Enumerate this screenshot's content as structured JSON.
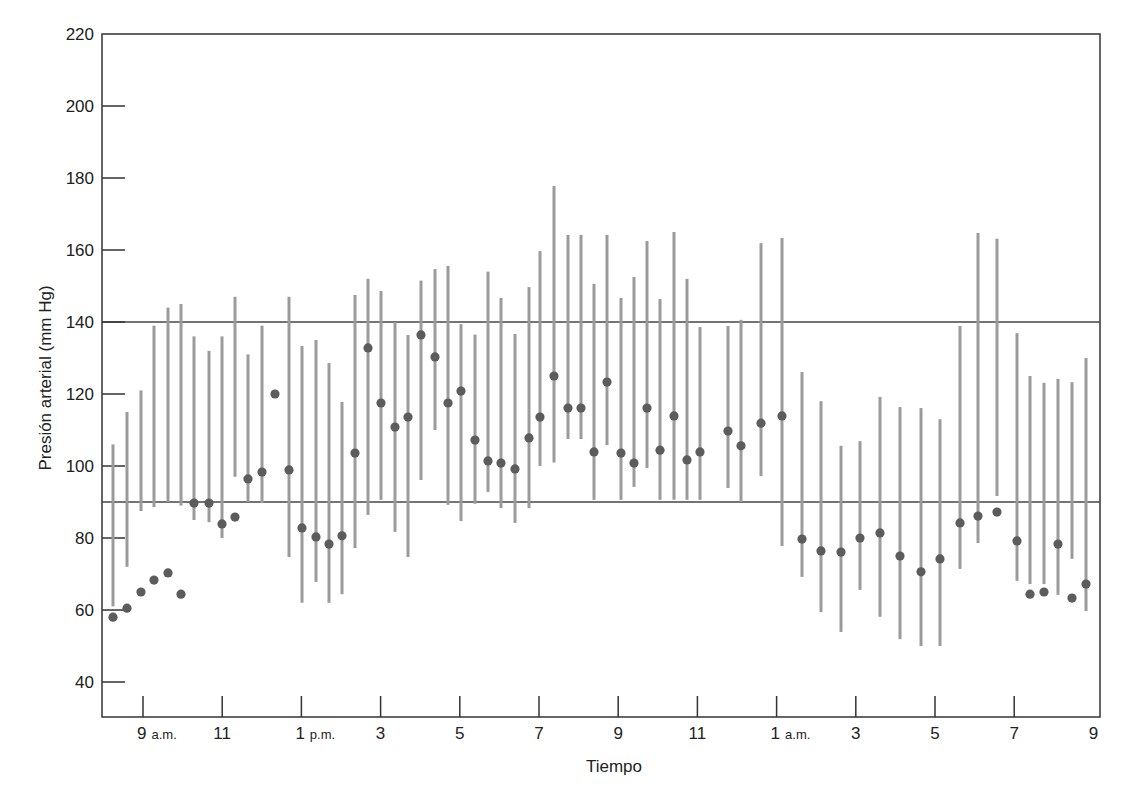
{
  "chart_data": {
    "type": "scatter",
    "subtype": "dot-with-range-bars",
    "title": "",
    "xlabel": "Tiempo",
    "ylabel": "Presión arterial (mm Hg)",
    "ylim": [
      30,
      220
    ],
    "yticks": [
      40,
      60,
      80,
      100,
      120,
      140,
      160,
      180,
      200,
      220
    ],
    "xticks": [
      {
        "label": "9",
        "suffix": "a.m.",
        "hour": 9
      },
      {
        "label": "11",
        "suffix": "",
        "hour": 11
      },
      {
        "label": "1",
        "suffix": "p.m.",
        "hour": 13
      },
      {
        "label": "3",
        "suffix": "",
        "hour": 15
      },
      {
        "label": "5",
        "suffix": "",
        "hour": 17
      },
      {
        "label": "7",
        "suffix": "",
        "hour": 19
      },
      {
        "label": "9",
        "suffix": "",
        "hour": 21
      },
      {
        "label": "11",
        "suffix": "",
        "hour": 23
      },
      {
        "label": "1",
        "suffix": "a.m.",
        "hour": 25
      },
      {
        "label": "3",
        "suffix": "",
        "hour": 27
      },
      {
        "label": "5",
        "suffix": "",
        "hour": 29
      },
      {
        "label": "7",
        "suffix": "",
        "hour": 31
      },
      {
        "label": "9",
        "suffix": "",
        "hour": 33
      }
    ],
    "reference_lines": [
      140,
      90
    ],
    "grid": false,
    "legend": null,
    "colors": {
      "dot": "#5c5c5c",
      "bar": "#9b9b9b",
      "axis": "#333333",
      "reference": "#444444"
    },
    "points": [
      {
        "x": 113,
        "value": 58,
        "low": 61,
        "high": 106
      },
      {
        "x": 127,
        "value": 60.5,
        "low": 72,
        "high": 115
      },
      {
        "x": 141,
        "value": 65,
        "low": 87.5,
        "high": 121
      },
      {
        "x": 154,
        "value": 68.3,
        "low": 88.6,
        "high": 139
      },
      {
        "x": 168,
        "value": 70.3,
        "low": 90,
        "high": 144
      },
      {
        "x": 181,
        "value": 64.4,
        "low": 89,
        "high": 145
      },
      {
        "x": 194,
        "value": 89.7,
        "low": 85,
        "high": 136
      },
      {
        "x": 209,
        "value": 89.7,
        "low": 84.4,
        "high": 132
      },
      {
        "x": 222,
        "value": 83.9,
        "low": 80,
        "high": 136
      },
      {
        "x": 235,
        "value": 85.8,
        "low": 97,
        "high": 147
      },
      {
        "x": 248,
        "value": 96.4,
        "low": 90,
        "high": 131
      },
      {
        "x": 262,
        "value": 98.3,
        "low": 89.7,
        "high": 139
      },
      {
        "x": 275,
        "value": 120,
        "low": null,
        "high": null
      },
      {
        "x": 289,
        "value": 98.9,
        "low": 74.7,
        "high": 147
      },
      {
        "x": 302,
        "value": 82.8,
        "low": 62,
        "high": 133.3
      },
      {
        "x": 316,
        "value": 80.3,
        "low": 67.8,
        "high": 135
      },
      {
        "x": 329,
        "value": 78.3,
        "low": 62,
        "high": 128.6
      },
      {
        "x": 342,
        "value": 80.6,
        "low": 64.4,
        "high": 117.8
      },
      {
        "x": 355,
        "value": 103.6,
        "low": 77.2,
        "high": 147.5
      },
      {
        "x": 368,
        "value": 132.8,
        "low": 86.4,
        "high": 152
      },
      {
        "x": 381,
        "value": 117.5,
        "low": 90.6,
        "high": 148.6
      },
      {
        "x": 395,
        "value": 110.8,
        "low": 81.7,
        "high": 140
      },
      {
        "x": 408,
        "value": 113.6,
        "low": 74.7,
        "high": 136.4
      },
      {
        "x": 421,
        "value": 136.4,
        "low": 96.1,
        "high": 151.5
      },
      {
        "x": 435,
        "value": 130.3,
        "low": 110,
        "high": 154.7
      },
      {
        "x": 448,
        "value": 117.5,
        "low": 89.2,
        "high": 155.6
      },
      {
        "x": 461,
        "value": 120.8,
        "low": 84.7,
        "high": 139.4
      },
      {
        "x": 475,
        "value": 107.2,
        "low": 89.5,
        "high": 136.5
      },
      {
        "x": 488,
        "value": 101.4,
        "low": 92.8,
        "high": 154
      },
      {
        "x": 501,
        "value": 100.8,
        "low": 88.3,
        "high": 146.7
      },
      {
        "x": 515,
        "value": 99.2,
        "low": 84.2,
        "high": 136.7
      },
      {
        "x": 529,
        "value": 107.8,
        "low": 88.3,
        "high": 149.7
      },
      {
        "x": 540,
        "value": 113.6,
        "low": 100,
        "high": 159.7
      },
      {
        "x": 554,
        "value": 125,
        "low": 101,
        "high": 177.8
      },
      {
        "x": 568,
        "value": 116.1,
        "low": 107.5,
        "high": 164.2
      },
      {
        "x": 581,
        "value": 116.1,
        "low": 107.5,
        "high": 164.2
      },
      {
        "x": 594,
        "value": 103.9,
        "low": 90.6,
        "high": 150.6
      },
      {
        "x": 607,
        "value": 123.3,
        "low": 105.8,
        "high": 164.2
      },
      {
        "x": 621,
        "value": 103.6,
        "low": 90.6,
        "high": 146.7
      },
      {
        "x": 634,
        "value": 100.8,
        "low": 94.2,
        "high": 152.5
      },
      {
        "x": 647,
        "value": 116.1,
        "low": 99.4,
        "high": 162.5
      },
      {
        "x": 660,
        "value": 104.4,
        "low": 90.6,
        "high": 146.4
      },
      {
        "x": 674,
        "value": 113.9,
        "low": 90.6,
        "high": 165
      },
      {
        "x": 687,
        "value": 101.7,
        "low": 90.6,
        "high": 152
      },
      {
        "x": 700,
        "value": 103.9,
        "low": 90.6,
        "high": 138.6
      },
      {
        "x": 728,
        "value": 109.7,
        "low": 93.9,
        "high": 138.9
      },
      {
        "x": 741,
        "value": 105.6,
        "low": 90,
        "high": 140.6
      },
      {
        "x": 761,
        "value": 111.9,
        "low": 97.2,
        "high": 161.9
      },
      {
        "x": 782,
        "value": 113.9,
        "low": 77.8,
        "high": 163.3
      },
      {
        "x": 802,
        "value": 79.7,
        "low": 69.2,
        "high": 126.1
      },
      {
        "x": 821,
        "value": 76.4,
        "low": 59.4,
        "high": 118
      },
      {
        "x": 841,
        "value": 76.1,
        "low": 53.9,
        "high": 105.6
      },
      {
        "x": 860,
        "value": 80,
        "low": 65.6,
        "high": 106.9
      },
      {
        "x": 880,
        "value": 81.4,
        "low": 58.1,
        "high": 119.2
      },
      {
        "x": 900,
        "value": 75,
        "low": 51.9,
        "high": 116.4
      },
      {
        "x": 921,
        "value": 70.6,
        "low": 50,
        "high": 116.1
      },
      {
        "x": 940,
        "value": 74.2,
        "low": 50,
        "high": 113
      },
      {
        "x": 960,
        "value": 84.2,
        "low": 71.4,
        "high": 138.9
      },
      {
        "x": 978,
        "value": 86.1,
        "low": 78.6,
        "high": 164.7
      },
      {
        "x": 997,
        "value": 87.2,
        "low": 91.7,
        "high": 163.1
      },
      {
        "x": 1017,
        "value": 79.2,
        "low": 68.1,
        "high": 136.9
      },
      {
        "x": 1030,
        "value": 64.4,
        "low": 67.2,
        "high": 125
      },
      {
        "x": 1044,
        "value": 65,
        "low": 67.2,
        "high": 123.1
      },
      {
        "x": 1058,
        "value": 78.3,
        "low": 64.2,
        "high": 124.2
      },
      {
        "x": 1072,
        "value": 63.3,
        "low": 74.2,
        "high": 123.3
      },
      {
        "x": 1086,
        "value": 67.2,
        "low": 59.7,
        "high": 130
      }
    ]
  }
}
